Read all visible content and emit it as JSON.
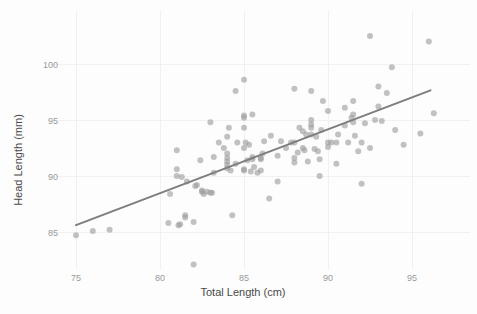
{
  "chart_data": {
    "type": "scatter",
    "title": "",
    "xlabel": "Total Length (cm)",
    "ylabel": "Head Length (mm)",
    "xlim": [
      73.8,
      97.2
    ],
    "ylim": [
      82.0,
      103.3
    ],
    "xticks": [
      75,
      80,
      85,
      90,
      95
    ],
    "yticks": [
      85,
      90,
      95,
      100
    ],
    "xticklabels": [
      "75",
      "80",
      "85",
      "90",
      "95"
    ],
    "yticklabels": [
      "85",
      "90",
      "95",
      "100"
    ],
    "grid": true,
    "legend": null,
    "point_color": "#9d9d9d",
    "point_opacity": 0.62,
    "point_radius": 3,
    "background_color": "#fdfdfd",
    "gridline_color": "#f1f1f1",
    "trendline": {
      "type": "linear-fit",
      "color": "#7d7d7d",
      "width": 2,
      "x_start": 75.0,
      "y_start": 85.62,
      "x_end": 96.1,
      "y_end": 97.65
    },
    "x": [
      75.0,
      76.0,
      77.0,
      80.5,
      80.6,
      81.0,
      81.0,
      81.0,
      81.1,
      81.2,
      81.3,
      81.5,
      81.5,
      81.6,
      82.0,
      82.0,
      82.1,
      82.2,
      82.4,
      82.5,
      82.5,
      82.6,
      82.8,
      83.0,
      83.0,
      83.1,
      83.2,
      83.2,
      83.5,
      83.8,
      84.0,
      84.0,
      84.0,
      84.0,
      84.0,
      84.0,
      84.1,
      84.2,
      84.3,
      84.5,
      84.5,
      84.6,
      85.0,
      85.0,
      85.0,
      85.0,
      85.0,
      85.0,
      85.0,
      85.1,
      85.2,
      85.3,
      85.4,
      85.5,
      85.5,
      85.5,
      85.6,
      85.8,
      86.0,
      86.0,
      86.0,
      86.1,
      86.2,
      86.5,
      86.6,
      87.0,
      87.0,
      87.2,
      87.5,
      87.8,
      88.0,
      88.0,
      88.0,
      88.0,
      88.2,
      88.3,
      88.5,
      88.5,
      88.6,
      88.7,
      88.8,
      89.0,
      89.0,
      89.0,
      89.0,
      89.0,
      89.2,
      89.3,
      89.4,
      89.5,
      89.5,
      89.6,
      89.7,
      90.0,
      90.0,
      90.0,
      90.2,
      90.5,
      90.5,
      90.6,
      91.0,
      91.0,
      91.2,
      91.4,
      91.5,
      91.5,
      91.5,
      91.6,
      91.8,
      92.0,
      92.0,
      92.2,
      92.5,
      92.5,
      92.8,
      93.0,
      93.0,
      93.2,
      93.5,
      93.8,
      94.0,
      94.5,
      95.5,
      96.0,
      96.3
    ],
    "y": [
      84.7,
      85.1,
      85.2,
      85.8,
      88.4,
      92.3,
      90.6,
      90.0,
      85.6,
      85.7,
      89.9,
      86.5,
      86.3,
      89.5,
      82.1,
      85.9,
      89.1,
      89.2,
      91.4,
      88.6,
      88.7,
      88.4,
      88.6,
      94.8,
      88.5,
      88.5,
      91.7,
      90.3,
      93.0,
      92.5,
      93.5,
      92.0,
      91.6,
      91.3,
      91.0,
      90.7,
      94.3,
      90.5,
      86.5,
      97.6,
      91.1,
      93.0,
      98.6,
      95.4,
      95.2,
      94.3,
      92.5,
      90.6,
      90.5,
      93.0,
      91.4,
      92.8,
      90.4,
      95.5,
      91.7,
      91.5,
      90.8,
      90.3,
      91.6,
      91.5,
      90.5,
      92.0,
      93.1,
      88.0,
      93.6,
      91.8,
      89.5,
      93.1,
      92.5,
      93.0,
      97.8,
      93.0,
      91.6,
      91.2,
      92.1,
      94.3,
      94.0,
      92.5,
      92.3,
      93.7,
      91.3,
      97.6,
      95.0,
      94.6,
      94.3,
      93.7,
      92.4,
      93.5,
      92.2,
      91.5,
      90.0,
      94.1,
      96.7,
      95.8,
      93.0,
      92.6,
      93.0,
      93.0,
      91.1,
      93.7,
      96.1,
      94.5,
      93.0,
      95.2,
      96.7,
      95.5,
      94.8,
      93.6,
      92.2,
      93.0,
      89.3,
      94.7,
      102.5,
      92.5,
      95.0,
      98.0,
      96.2,
      94.9,
      97.4,
      99.7,
      94.1,
      92.8,
      93.8,
      102.0,
      95.6
    ]
  }
}
